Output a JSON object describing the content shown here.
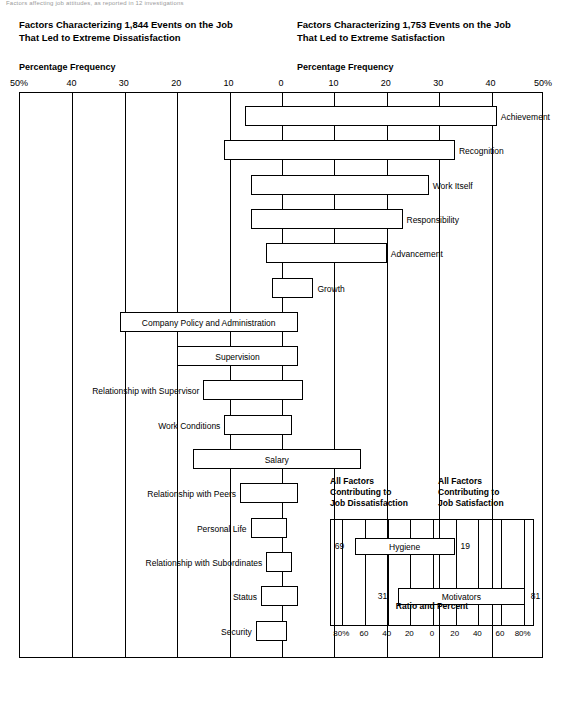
{
  "topnote": "Factors affecting job attitudes, as reported in 12 investigations",
  "titles": {
    "left": "Factors Characterizing 1,844 Events on the Job\nThat Led to Extreme Dissatisfaction",
    "right": "Factors Characterizing 1,753 Events on the Job\nThat Led to Extreme Satisfaction"
  },
  "axis_labels": {
    "left": "Percentage Frequency",
    "right": "Percentage Frequency"
  },
  "chart_data": {
    "type": "bar",
    "xlabel": "Percentage Frequency",
    "ylabel": "",
    "xlim": [
      -50,
      50
    ],
    "grid": true,
    "legend": "none",
    "ticks_left": [
      "50%",
      "40",
      "30",
      "20",
      "10",
      "0"
    ],
    "ticks_right": [
      "10",
      "20",
      "30",
      "40",
      "50%"
    ],
    "series": [
      {
        "name": "Dissatisfaction (left)",
        "label": "dissatisfaction"
      },
      {
        "name": "Satisfaction (right)",
        "label": "satisfaction"
      }
    ],
    "factors": [
      {
        "label": "Achievement",
        "satisfaction": 41,
        "dissatisfaction": 7,
        "label_side": "right"
      },
      {
        "label": "Recognition",
        "satisfaction": 33,
        "dissatisfaction": 11,
        "label_side": "right"
      },
      {
        "label": "Work Itself",
        "satisfaction": 28,
        "dissatisfaction": 6,
        "label_side": "right"
      },
      {
        "label": "Responsibility",
        "satisfaction": 23,
        "dissatisfaction": 6,
        "label_side": "right"
      },
      {
        "label": "Advancement",
        "satisfaction": 20,
        "dissatisfaction": 3,
        "label_side": "right"
      },
      {
        "label": "Growth",
        "satisfaction": 6,
        "dissatisfaction": 2,
        "label_side": "right"
      },
      {
        "label": "Company Policy and Administration",
        "satisfaction": 3,
        "dissatisfaction": 31,
        "label_side": "inside-left"
      },
      {
        "label": "Supervision",
        "satisfaction": 3,
        "dissatisfaction": 20,
        "label_side": "inside-left"
      },
      {
        "label": "Relationship with Supervisor",
        "satisfaction": 4,
        "dissatisfaction": 15,
        "label_side": "left"
      },
      {
        "label": "Work Conditions",
        "satisfaction": 2,
        "dissatisfaction": 11,
        "label_side": "left"
      },
      {
        "label": "Salary",
        "satisfaction": 15,
        "dissatisfaction": 17,
        "label_side": "inside-left"
      },
      {
        "label": "Relationship with Peers",
        "satisfaction": 3,
        "dissatisfaction": 8,
        "label_side": "left"
      },
      {
        "label": "Personal Life",
        "satisfaction": 1,
        "dissatisfaction": 6,
        "label_side": "left"
      },
      {
        "label": "Relationship with Subordinates",
        "satisfaction": 2,
        "dissatisfaction": 3,
        "label_side": "left"
      },
      {
        "label": "Status",
        "satisfaction": 3,
        "dissatisfaction": 4,
        "label_side": "left"
      },
      {
        "label": "Security",
        "satisfaction": 1,
        "dissatisfaction": 5,
        "label_side": "left"
      }
    ]
  },
  "inset": {
    "title_left": "All Factors\nContributing to\nJob Dissatisfaction",
    "title_right": "All Factors\nContributing to\nJob Satisfaction",
    "axis_label": "Ratio and Percent",
    "ticks": [
      "80%",
      "60",
      "40",
      "20",
      "0",
      "20",
      "40",
      "60",
      "80%"
    ],
    "chart_data": {
      "type": "bar",
      "categories": [
        "Hygiene",
        "Motivators"
      ],
      "series": [
        {
          "name": "Job Dissatisfaction",
          "values": [
            69,
            31
          ]
        },
        {
          "name": "Job Satisfaction",
          "values": [
            19,
            81
          ]
        }
      ],
      "xlim": [
        -90,
        90
      ],
      "rows": [
        {
          "name": "Hygiene",
          "left_value": 69,
          "right_value": 19
        },
        {
          "name": "Motivators",
          "left_value": 31,
          "right_value": 81
        }
      ]
    }
  }
}
